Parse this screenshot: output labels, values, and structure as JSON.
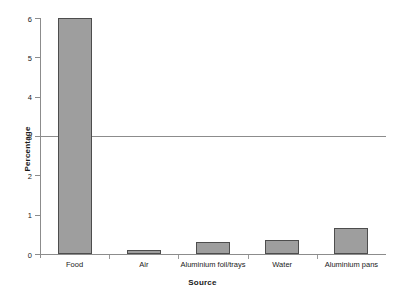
{
  "chart_data": {
    "type": "bar",
    "title": "",
    "subtitle": "",
    "xlabel": "Source",
    "ylabel": "Percentage",
    "categories": [
      "Food",
      "Air",
      "Aluminium foil/trays",
      "Water",
      "Aluminium pans"
    ],
    "values": [
      6.0,
      0.1,
      0.3,
      0.35,
      0.65
    ],
    "series": [
      {
        "name": "Percentage",
        "values": [
          6.0,
          0.1,
          0.3,
          0.35,
          0.65
        ]
      }
    ],
    "ylim": [
      0,
      6
    ],
    "ytick_labels": [
      "0",
      "1",
      "2",
      "3",
      "4",
      "5",
      "6"
    ],
    "ytick_values": [
      0,
      1,
      2,
      3,
      4,
      5,
      6
    ],
    "grid": false,
    "legend": "none",
    "annotations": [
      {
        "type": "reference-line",
        "orientation": "horizontal",
        "value": 3
      }
    ],
    "bar_fill_color": "#9e9e9e",
    "bar_border_color": "#4d4d4d",
    "axis_color": "#8c8c8c",
    "background_color": "#ffffff"
  }
}
